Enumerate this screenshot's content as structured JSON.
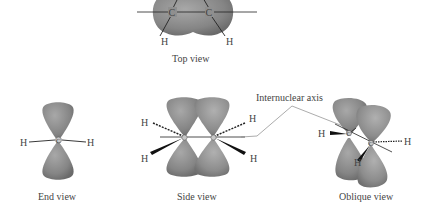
{
  "views": {
    "top": {
      "caption": "Top view",
      "atoms": {
        "c1": "C",
        "c2": "C",
        "h1": "H",
        "h2": "H"
      }
    },
    "end": {
      "caption": "End view",
      "atoms": {
        "c": "C",
        "h_left": "H",
        "h_right": "H"
      }
    },
    "side": {
      "caption": "Side view",
      "atoms": {
        "h_top_left": "H",
        "h_bottom_left": "H",
        "h_top_right": "H",
        "h_bottom_right": "H"
      }
    },
    "oblique": {
      "caption": "Oblique view",
      "atoms": {
        "c1": "C",
        "c2": "C",
        "h_left": "H",
        "h_right": "H",
        "h_bottom": "H"
      }
    }
  },
  "annotation": {
    "internuclear_axis": "Internuclear axis"
  },
  "colors": {
    "lobe": "#8a8a8a",
    "lobe_dark": "#6f6f6f",
    "bond": "#222222",
    "text": "#444444"
  }
}
